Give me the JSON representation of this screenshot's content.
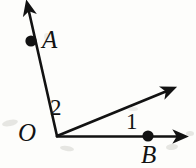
{
  "figure": {
    "type": "geometry-diagram",
    "background_color": "#fdfdfb",
    "stroke_color": "#121212",
    "points": [
      {
        "name": "O",
        "label": "O",
        "x": 57,
        "y": 136,
        "has_dot": false
      },
      {
        "name": "A",
        "label": "A",
        "x": 31,
        "y": 41,
        "has_dot": true
      },
      {
        "name": "B",
        "label": "B",
        "x": 148,
        "y": 136,
        "has_dot": true
      }
    ],
    "rays": [
      {
        "name": "ray-OA",
        "from_x": 57,
        "from_y": 136,
        "to_x": 28,
        "to_y": 7,
        "arrow": true
      },
      {
        "name": "ray-middle",
        "from_x": 57,
        "from_y": 136,
        "to_x": 172,
        "to_y": 89,
        "arrow": true
      },
      {
        "name": "ray-OB",
        "from_x": 57,
        "from_y": 136,
        "to_x": 184,
        "to_y": 136,
        "arrow": true
      }
    ],
    "angle_labels": [
      {
        "name": "angle-2",
        "label": "2",
        "x": 57,
        "y": 107
      },
      {
        "name": "angle-1",
        "label": "1",
        "x": 132,
        "y": 121
      }
    ],
    "labels": {
      "point_a": "A",
      "point_o": "O",
      "point_b": "B",
      "angle_one": "1",
      "angle_two": "2"
    }
  }
}
